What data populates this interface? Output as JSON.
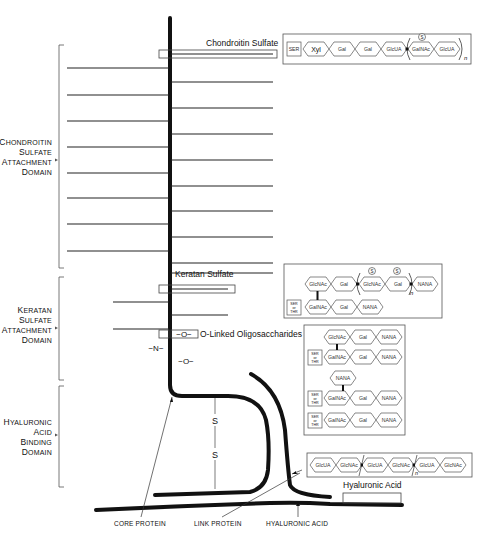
{
  "domains": {
    "chondroitin": {
      "lines": [
        "Chondroitin",
        "Sulfate",
        "Attachment",
        "Domain"
      ]
    },
    "keratan": {
      "lines": [
        "Keratan",
        "Sulfate",
        "Attachment",
        "Domain"
      ]
    },
    "hyaluronic": {
      "lines": [
        "Hyaluronic",
        "Acid",
        "Binding",
        "Domain"
      ]
    }
  },
  "captions": {
    "chondroitin_sulfate": "Chondroitin Sulfate",
    "keratan_sulfate": "Keratan Sulfate",
    "o_linked": "O-Linked Oligosaccharides",
    "hyaluronic_acid": "Hyaluronic Acid"
  },
  "bond_labels": {
    "o_link_1": "−O−",
    "n_link": "−N−",
    "o_link_2": "−O−",
    "s1": "S",
    "s2": "S"
  },
  "bottom_labels": {
    "core_protein": "CORE PROTEIN",
    "link_protein": "LINK PROTEIN",
    "hyaluronic_acid": "HYALURONIC ACID"
  },
  "chondroitin_chain": {
    "anchor": "SER",
    "sugars": [
      "Xyl",
      "Gal",
      "Gal",
      "GlcUA",
      "GalNAc",
      "GlcUA"
    ],
    "sulfate_mark": "S",
    "repeat": "n"
  },
  "keratan_chain": {
    "anchor": [
      "SER",
      "or",
      "THR"
    ],
    "top_row": [
      "GlcNAc",
      "Gal",
      "GlcNAc",
      "Gal",
      "NANA"
    ],
    "bottom_row": [
      "GalNAc",
      "Gal",
      "NANA"
    ],
    "sulfate_mark": "S",
    "repeat": "n"
  },
  "o_linked_chains": {
    "anchor": [
      "SER",
      "or",
      "THR"
    ],
    "chain1_top": [
      "GlcNAc",
      "Gal",
      "NANA"
    ],
    "chain1_bottom": [
      "GalNAc",
      "Gal",
      "NANA"
    ],
    "chain2_top": [
      "NANA"
    ],
    "chain2_bottom": [
      "GalNAc",
      "Gal",
      "NANA"
    ],
    "chain3": [
      "GalNAc",
      "Gal",
      "NANA"
    ]
  },
  "hyaluronic_chain": {
    "sugars": [
      "GlcUA",
      "GlcNAc",
      "GlcUA",
      "GlcNAc",
      "GlcUA",
      "GlcNAc"
    ],
    "repeat": "n"
  }
}
